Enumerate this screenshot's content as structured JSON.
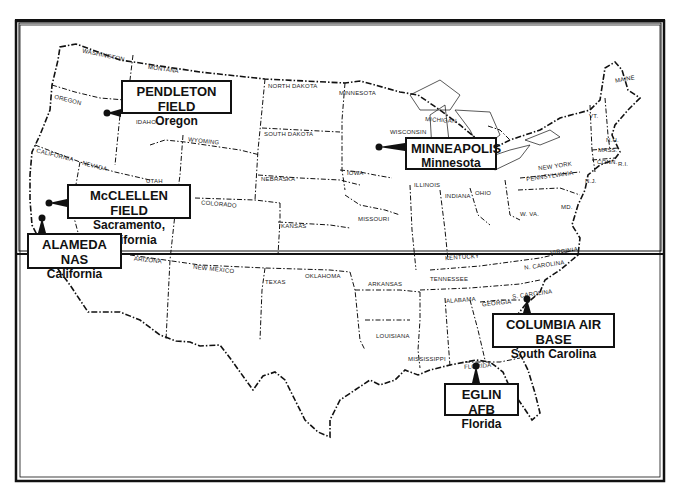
{
  "map": {
    "title": "",
    "colors": {
      "ink": "#111111",
      "background": "#ffffff"
    },
    "states": [
      {
        "label": "WASHINGTON",
        "x": 82,
        "y": 52,
        "rot": 12
      },
      {
        "label": "MONTANA",
        "x": 148,
        "y": 66,
        "rot": 8
      },
      {
        "label": "OREGON",
        "x": 54,
        "y": 97,
        "rot": 14
      },
      {
        "label": "IDAHO",
        "x": 136,
        "y": 119,
        "rot": 0
      },
      {
        "label": "WYOMING",
        "x": 188,
        "y": 138,
        "rot": 6
      },
      {
        "label": "NORTH DAKOTA",
        "x": 268,
        "y": 83,
        "rot": 0
      },
      {
        "label": "SOUTH DAKOTA",
        "x": 264,
        "y": 131,
        "rot": 0
      },
      {
        "label": "MINNESOTA",
        "x": 339,
        "y": 90,
        "rot": 0
      },
      {
        "label": "CALIFORNIA",
        "x": 36,
        "y": 152,
        "rot": 14
      },
      {
        "label": "NEVADA",
        "x": 82,
        "y": 163,
        "rot": 14
      },
      {
        "label": "UTAH",
        "x": 146,
        "y": 178,
        "rot": 0
      },
      {
        "label": "COLORADO",
        "x": 201,
        "y": 201,
        "rot": 5
      },
      {
        "label": "NEBRASKA",
        "x": 261,
        "y": 176,
        "rot": 0
      },
      {
        "label": "KANSAS",
        "x": 281,
        "y": 223,
        "rot": 0
      },
      {
        "label": "IOWA",
        "x": 347,
        "y": 170,
        "rot": 0
      },
      {
        "label": "WISCONSIN",
        "x": 390,
        "y": 129,
        "rot": 0
      },
      {
        "label": "MICHIGAN",
        "x": 425,
        "y": 117,
        "rot": 4
      },
      {
        "label": "ILLINOIS",
        "x": 414,
        "y": 182,
        "rot": 0
      },
      {
        "label": "INDIANA",
        "x": 445,
        "y": 193,
        "rot": 0
      },
      {
        "label": "OHIO",
        "x": 475,
        "y": 190,
        "rot": 0
      },
      {
        "label": "MISSOURI",
        "x": 358,
        "y": 216,
        "rot": 0
      },
      {
        "label": "NEW YORK",
        "x": 538,
        "y": 163,
        "rot": -8
      },
      {
        "label": "PENNSYLVANIA",
        "x": 526,
        "y": 173,
        "rot": -8
      },
      {
        "label": "VT.",
        "x": 589,
        "y": 113,
        "rot": 0
      },
      {
        "label": "MAINE",
        "x": 615,
        "y": 76,
        "rot": -10
      },
      {
        "label": "N.H.",
        "x": 606,
        "y": 137,
        "rot": 0
      },
      {
        "label": "MASS.",
        "x": 598,
        "y": 147,
        "rot": 0
      },
      {
        "label": "CONN.",
        "x": 597,
        "y": 159,
        "rot": 0
      },
      {
        "label": "R.I.",
        "x": 618,
        "y": 161,
        "rot": 0
      },
      {
        "label": "N.J.",
        "x": 585,
        "y": 178,
        "rot": 0
      },
      {
        "label": "MD.",
        "x": 561,
        "y": 204,
        "rot": 0
      },
      {
        "label": "W. VA.",
        "x": 520,
        "y": 211,
        "rot": 0
      },
      {
        "label": "KENTUCKY",
        "x": 445,
        "y": 254,
        "rot": -4
      },
      {
        "label": "VIRGINIA",
        "x": 550,
        "y": 248,
        "rot": -8
      },
      {
        "label": "N. CAROLINA",
        "x": 524,
        "y": 262,
        "rot": -8
      },
      {
        "label": "TENNESSEE",
        "x": 430,
        "y": 276,
        "rot": 0
      },
      {
        "label": "ARKANSAS",
        "x": 368,
        "y": 281,
        "rot": 0
      },
      {
        "label": "OKLAHOMA",
        "x": 305,
        "y": 273,
        "rot": 0
      },
      {
        "label": "TEXAS",
        "x": 265,
        "y": 279,
        "rot": 0
      },
      {
        "label": "ARIZONA",
        "x": 134,
        "y": 257,
        "rot": 6
      },
      {
        "label": "NEW MEXICO",
        "x": 193,
        "y": 266,
        "rot": 6
      },
      {
        "label": "ALABAMA",
        "x": 446,
        "y": 297,
        "rot": -4
      },
      {
        "label": "GEORGIA",
        "x": 482,
        "y": 300,
        "rot": -6
      },
      {
        "label": "S. CAROLINA",
        "x": 512,
        "y": 291,
        "rot": -8
      },
      {
        "label": "LOUISIANA",
        "x": 376,
        "y": 333,
        "rot": 0
      },
      {
        "label": "MISSISSIPPI",
        "x": 408,
        "y": 356,
        "rot": 0
      },
      {
        "label": "FLORIDA",
        "x": 464,
        "y": 363,
        "rot": -4
      }
    ],
    "callouts": [
      {
        "name": "PENDLETON FIELD",
        "location": "Oregon",
        "box": [
          121,
          80,
          111,
          34
        ],
        "pin": [
          107,
          113
        ]
      },
      {
        "name": "MINNEAPOLIS",
        "location": "Minnesota",
        "box": [
          405,
          137,
          92,
          33
        ],
        "pin": [
          379,
          147
        ]
      },
      {
        "name": "McCLELLEN FIELD",
        "location": "Sacramento, California",
        "box": [
          67,
          184,
          124,
          35
        ],
        "pin": [
          49,
          203
        ]
      },
      {
        "name": "ALAMEDA NAS",
        "location": "California",
        "box": [
          27,
          233,
          95,
          36
        ],
        "pin": [
          42,
          218
        ]
      },
      {
        "name": "COLUMBIA AIR BASE",
        "location": "South Carolina",
        "box": [
          492,
          313,
          123,
          35
        ],
        "pin": [
          527,
          299
        ]
      },
      {
        "name": "EGLIN AFB",
        "location": "Florida",
        "box": [
          444,
          383,
          75,
          33
        ],
        "pin": [
          476,
          366
        ]
      }
    ]
  }
}
